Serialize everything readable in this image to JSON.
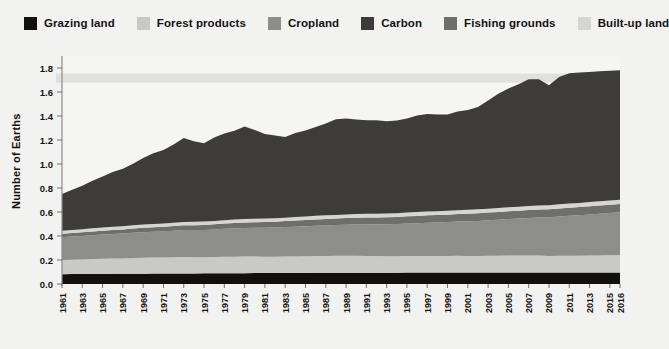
{
  "chart_data": {
    "type": "area",
    "title": "",
    "subtitle": "",
    "xlabel": "",
    "ylabel": "Number of Earths",
    "stacked": true,
    "grid": false,
    "legend_position": "top",
    "ylim": [
      0.0,
      1.9
    ],
    "yticks": [
      "0.0",
      "0.2",
      "0.4",
      "0.6",
      "0.8",
      "1.0",
      "1.2",
      "1.4",
      "1.6",
      "1.8"
    ],
    "ytick_values": [
      0.0,
      0.2,
      0.4,
      0.6,
      0.8,
      1.0,
      1.2,
      1.4,
      1.6,
      1.8
    ],
    "xlim": [
      1961,
      2016
    ],
    "xtick_labels": [
      "1961",
      "1963",
      "1965",
      "1967",
      "1969",
      "1971",
      "1973",
      "1975",
      "1977",
      "1979",
      "1981",
      "1983",
      "1985",
      "1987",
      "1989",
      "1991",
      "1993",
      "1995",
      "1997",
      "1999",
      "2001",
      "2003",
      "2005",
      "2007",
      "2009",
      "2011",
      "2013",
      "2015",
      "2016"
    ],
    "xtick_values": [
      1961,
      1963,
      1965,
      1967,
      1969,
      1971,
      1973,
      1975,
      1977,
      1979,
      1981,
      1983,
      1985,
      1987,
      1989,
      1991,
      1993,
      1995,
      1997,
      1999,
      2001,
      2003,
      2005,
      2007,
      2009,
      2011,
      2013,
      2015,
      2016
    ],
    "x": [
      1961,
      1962,
      1963,
      1964,
      1965,
      1966,
      1967,
      1968,
      1969,
      1970,
      1971,
      1972,
      1973,
      1974,
      1975,
      1976,
      1977,
      1978,
      1979,
      1980,
      1981,
      1982,
      1983,
      1984,
      1985,
      1986,
      1987,
      1988,
      1989,
      1990,
      1991,
      1992,
      1993,
      1994,
      1995,
      1996,
      1997,
      1998,
      1999,
      2000,
      2001,
      2002,
      2003,
      2004,
      2005,
      2006,
      2007,
      2008,
      2009,
      2010,
      2011,
      2012,
      2013,
      2014,
      2015,
      2016
    ],
    "series": [
      {
        "name": "Grazing land",
        "color": "#12100f",
        "values": [
          0.082,
          0.083,
          0.083,
          0.084,
          0.084,
          0.085,
          0.085,
          0.086,
          0.086,
          0.087,
          0.087,
          0.088,
          0.088,
          0.088,
          0.089,
          0.089,
          0.09,
          0.09,
          0.09,
          0.091,
          0.091,
          0.091,
          0.092,
          0.092,
          0.092,
          0.093,
          0.093,
          0.093,
          0.093,
          0.094,
          0.094,
          0.094,
          0.094,
          0.094,
          0.095,
          0.095,
          0.095,
          0.095,
          0.095,
          0.096,
          0.096,
          0.096,
          0.096,
          0.096,
          0.096,
          0.096,
          0.096,
          0.096,
          0.096,
          0.096,
          0.096,
          0.096,
          0.096,
          0.096,
          0.096,
          0.096
        ]
      },
      {
        "name": "Forest products",
        "color": "#c9c9c7",
        "values": [
          0.118,
          0.12,
          0.122,
          0.124,
          0.126,
          0.127,
          0.128,
          0.13,
          0.132,
          0.133,
          0.134,
          0.135,
          0.137,
          0.135,
          0.133,
          0.135,
          0.137,
          0.138,
          0.139,
          0.138,
          0.137,
          0.136,
          0.137,
          0.138,
          0.139,
          0.14,
          0.141,
          0.142,
          0.142,
          0.141,
          0.14,
          0.139,
          0.138,
          0.138,
          0.138,
          0.138,
          0.139,
          0.138,
          0.138,
          0.139,
          0.138,
          0.138,
          0.139,
          0.14,
          0.141,
          0.142,
          0.142,
          0.141,
          0.138,
          0.14,
          0.14,
          0.14,
          0.141,
          0.142,
          0.143,
          0.144
        ]
      },
      {
        "name": "Cropland",
        "color": "#8d8d8b",
        "values": [
          0.19,
          0.193,
          0.196,
          0.199,
          0.202,
          0.205,
          0.208,
          0.211,
          0.214,
          0.216,
          0.219,
          0.221,
          0.224,
          0.226,
          0.228,
          0.231,
          0.233,
          0.235,
          0.237,
          0.239,
          0.241,
          0.243,
          0.245,
          0.248,
          0.25,
          0.252,
          0.254,
          0.256,
          0.258,
          0.26,
          0.262,
          0.264,
          0.266,
          0.268,
          0.271,
          0.274,
          0.277,
          0.28,
          0.283,
          0.286,
          0.289,
          0.292,
          0.296,
          0.3,
          0.304,
          0.308,
          0.313,
          0.318,
          0.322,
          0.327,
          0.332,
          0.337,
          0.342,
          0.347,
          0.352,
          0.357
        ]
      },
      {
        "name": "Fishing grounds",
        "color": "#6e6e6c",
        "values": [
          0.028,
          0.029,
          0.03,
          0.031,
          0.032,
          0.033,
          0.034,
          0.035,
          0.036,
          0.037,
          0.038,
          0.039,
          0.04,
          0.041,
          0.042,
          0.043,
          0.044,
          0.045,
          0.046,
          0.047,
          0.048,
          0.049,
          0.05,
          0.051,
          0.052,
          0.053,
          0.054,
          0.055,
          0.056,
          0.057,
          0.058,
          0.058,
          0.059,
          0.059,
          0.06,
          0.06,
          0.061,
          0.061,
          0.062,
          0.062,
          0.063,
          0.063,
          0.064,
          0.064,
          0.065,
          0.065,
          0.066,
          0.066,
          0.067,
          0.067,
          0.068,
          0.068,
          0.069,
          0.069,
          0.07,
          0.07
        ]
      },
      {
        "name": "Built-up land",
        "color": "#d5d5d3",
        "values": [
          0.026,
          0.026,
          0.026,
          0.026,
          0.026,
          0.027,
          0.027,
          0.027,
          0.027,
          0.027,
          0.027,
          0.028,
          0.028,
          0.028,
          0.028,
          0.028,
          0.028,
          0.029,
          0.029,
          0.029,
          0.029,
          0.029,
          0.029,
          0.03,
          0.03,
          0.03,
          0.03,
          0.03,
          0.03,
          0.031,
          0.031,
          0.031,
          0.031,
          0.031,
          0.031,
          0.032,
          0.032,
          0.032,
          0.032,
          0.032,
          0.032,
          0.033,
          0.033,
          0.033,
          0.033,
          0.033,
          0.034,
          0.034,
          0.034,
          0.034,
          0.034,
          0.035,
          0.035,
          0.035,
          0.035,
          0.035
        ]
      },
      {
        "name": "Carbon",
        "color": "#3d3c3b",
        "values": [
          0.306,
          0.335,
          0.362,
          0.396,
          0.425,
          0.456,
          0.478,
          0.513,
          0.556,
          0.589,
          0.612,
          0.651,
          0.7,
          0.672,
          0.653,
          0.695,
          0.722,
          0.74,
          0.772,
          0.74,
          0.705,
          0.69,
          0.672,
          0.7,
          0.716,
          0.74,
          0.766,
          0.796,
          0.8,
          0.788,
          0.78,
          0.778,
          0.768,
          0.772,
          0.785,
          0.806,
          0.812,
          0.806,
          0.802,
          0.822,
          0.832,
          0.852,
          0.902,
          0.952,
          0.99,
          1.02,
          1.056,
          1.052,
          1.0,
          1.06,
          1.086,
          1.086,
          1.084,
          1.084,
          1.082,
          1.08
        ]
      }
    ],
    "band": {
      "name": "biocapacity-reference-band",
      "color": "#dededa",
      "value": 1.72
    }
  },
  "legend": {
    "items": [
      {
        "label": "Grazing land",
        "color": "#12100f"
      },
      {
        "label": "Forest products",
        "color": "#c9c9c7"
      },
      {
        "label": "Cropland",
        "color": "#8d8d8b"
      },
      {
        "label": "Carbon",
        "color": "#3d3c3b"
      },
      {
        "label": "Fishing grounds",
        "color": "#6e6e6c"
      },
      {
        "label": "Built-up land",
        "color": "#d5d5d3"
      }
    ]
  },
  "colors": {
    "page_background": "#f2f2f0",
    "plot_background": "#f5f5f3",
    "axis": "#8a8a8a",
    "text": "#131313"
  }
}
